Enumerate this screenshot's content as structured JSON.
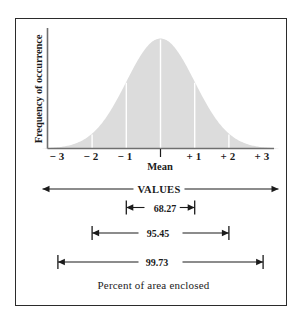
{
  "figure": {
    "caption": "Percent of area enclosed",
    "values_axis_label": "VALUES",
    "mean_label": "Mean",
    "ylabel": "Frequency of occurrence",
    "colors": {
      "curve_fill": "#dcdcdc",
      "gridline": "#ffffff",
      "axis": "#6f6f6f",
      "ink": "#1b1b1b",
      "frame": "#2b2b2b",
      "background": "#ffffff"
    }
  },
  "chart_data": {
    "type": "area",
    "title": "",
    "subtitle": "",
    "xlabel": "Mean",
    "ylabel": "Frequency of occurrence",
    "distribution": "normal",
    "mean": 0,
    "sigma": 1,
    "xlim": [
      -3.4,
      3.4
    ],
    "ylim": [
      0,
      1
    ],
    "grid": true,
    "gridlines_at": [
      -2,
      -1,
      0,
      1,
      2
    ],
    "legend": "none",
    "tick_labels": [
      "− 3",
      "− 2",
      "− 1",
      "|",
      "+ 1",
      "+ 2",
      "+ 3"
    ],
    "tick_values": [
      -3,
      -2,
      -1,
      0,
      1,
      2,
      3
    ],
    "x": [
      -3.4,
      -3.0,
      -2.5,
      -2.0,
      -1.5,
      -1.0,
      -0.5,
      0.0,
      0.5,
      1.0,
      1.5,
      2.0,
      2.5,
      3.0,
      3.4
    ],
    "values": [
      0.003,
      0.011,
      0.044,
      0.135,
      0.325,
      0.607,
      0.882,
      1.0,
      0.882,
      0.607,
      0.325,
      0.135,
      0.044,
      0.011,
      0.003
    ],
    "annotations": [
      {
        "label": "68.27",
        "from": -1,
        "to": 1,
        "sigma": 1
      },
      {
        "label": "95.45",
        "from": -2,
        "to": 2,
        "sigma": 2
      },
      {
        "label": "99.73",
        "from": -3,
        "to": 3,
        "sigma": 3
      }
    ]
  },
  "dimension_rows": [
    {
      "name": "values-span",
      "label": "VALUES",
      "from": -3.45,
      "to": 3.45
    },
    {
      "name": "sigma-1-span",
      "label": "68.27",
      "from": -1,
      "to": 1
    },
    {
      "name": "sigma-2-span",
      "label": "95.45",
      "from": -2,
      "to": 2
    },
    {
      "name": "sigma-3-span",
      "label": "99.73",
      "from": -3,
      "to": 3
    }
  ]
}
